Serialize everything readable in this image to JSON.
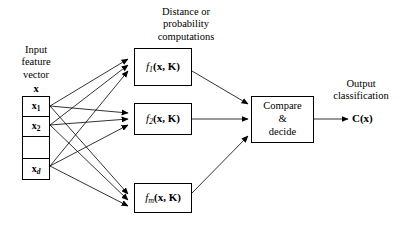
{
  "diagram": {
    "background": "#ffffff",
    "stroke": "#000000"
  },
  "input": {
    "label_lines": "Input\nfeature\nvector",
    "vector_symbol": "x",
    "cells": [
      {
        "name": "x-1",
        "base": "x",
        "sub": "1",
        "sub_italic": false
      },
      {
        "name": "x-2",
        "base": "x",
        "sub": "2",
        "sub_italic": false
      },
      {
        "name": "x-gap",
        "base": "",
        "sub": "",
        "sub_italic": false
      },
      {
        "name": "x-d",
        "base": "x",
        "sub": "d",
        "sub_italic": true
      }
    ]
  },
  "computations": {
    "header_lines": "Distance or\nprobability\ncomputations",
    "functions": [
      {
        "name": "f-1",
        "fn": "f",
        "sub": "1",
        "args": "(x, K)"
      },
      {
        "name": "f-2",
        "fn": "f",
        "sub": "2",
        "args": "(x, K)"
      },
      {
        "name": "f-m",
        "fn": "f",
        "sub": "m",
        "args": "(x, K)"
      }
    ]
  },
  "decision": {
    "line1": "Compare",
    "line2": "&",
    "line3": "decide"
  },
  "output": {
    "label_lines": "Output\nclassification",
    "value_bold": "C",
    "value_arg": "(x)"
  }
}
